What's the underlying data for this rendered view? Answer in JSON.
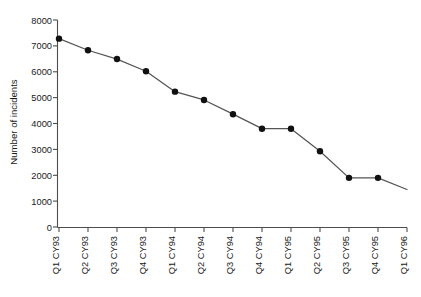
{
  "chart_data": {
    "type": "line",
    "title": "",
    "xlabel": "",
    "ylabel": "Number of incidents",
    "ylim": [
      0,
      8000
    ],
    "ytick_step": 1000,
    "yticks": [
      "0",
      "1000",
      "2000",
      "3000",
      "4000",
      "5000",
      "6000",
      "7000",
      "8000"
    ],
    "grid": false,
    "legend": "none",
    "xtick_rotation_deg": 90,
    "categories": [
      "Q1 CY93",
      "Q2 CY93",
      "Q3 CY93",
      "Q4 CY93",
      "Q1 CY94",
      "Q2 CY94",
      "Q3 CY94",
      "Q4 CY94",
      "Q1 CY95",
      "Q2 CY95",
      "Q3 CY95",
      "Q4 CY95",
      "Q1 CY96"
    ],
    "series": [
      {
        "name": "Number of incidents",
        "values": [
          7280,
          6830,
          6490,
          6020,
          5230,
          4910,
          4360,
          3800,
          3800,
          2930,
          1900,
          1900,
          1450
        ],
        "marker": "filled-circle",
        "marker_at_last_point": false,
        "line_color": "#555555",
        "marker_color": "#111111"
      }
    ],
    "annotations": []
  },
  "figure": {
    "caption": ""
  }
}
